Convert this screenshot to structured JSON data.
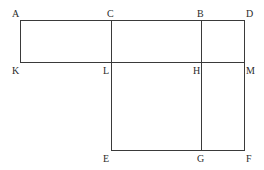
{
  "figure": {
    "background_color": "#ffffff",
    "line_color": "#3a3a3a",
    "label_color": "#2b2b2b",
    "width": 264,
    "height": 170,
    "vertices": [
      {
        "id": "A",
        "label": "A",
        "x": 20,
        "y": 20,
        "label_x": 12,
        "label_y": 9
      },
      {
        "id": "C",
        "label": "C",
        "x": 111,
        "y": 20,
        "label_x": 107,
        "label_y": 9
      },
      {
        "id": "B",
        "label": "B",
        "x": 201,
        "y": 20,
        "label_x": 197,
        "label_y": 9
      },
      {
        "id": "D",
        "label": "D",
        "x": 244,
        "y": 20,
        "label_x": 246,
        "label_y": 9
      },
      {
        "id": "K",
        "label": "K",
        "x": 20,
        "y": 62,
        "label_x": 12,
        "label_y": 66
      },
      {
        "id": "L",
        "label": "L",
        "x": 111,
        "y": 62,
        "label_x": 103,
        "label_y": 66
      },
      {
        "id": "H",
        "label": "H",
        "x": 201,
        "y": 62,
        "label_x": 193,
        "label_y": 66
      },
      {
        "id": "M",
        "label": "M",
        "x": 244,
        "y": 62,
        "label_x": 246,
        "label_y": 66
      },
      {
        "id": "E",
        "label": "E",
        "x": 111,
        "y": 150,
        "label_x": 103,
        "label_y": 154
      },
      {
        "id": "G",
        "label": "G",
        "x": 201,
        "y": 150,
        "label_x": 197,
        "label_y": 154
      },
      {
        "id": "F",
        "label": "F",
        "x": 244,
        "y": 150,
        "label_x": 246,
        "label_y": 154
      }
    ],
    "segments": [
      {
        "id": "A-D",
        "name": "top-edge",
        "x1": 20,
        "y1": 20,
        "x2": 244,
        "y2": 20
      },
      {
        "id": "K-M",
        "name": "middle-horizontal",
        "x1": 20,
        "y1": 62,
        "x2": 244,
        "y2": 62
      },
      {
        "id": "E-F",
        "name": "bottom-edge",
        "x1": 111,
        "y1": 150,
        "x2": 244,
        "y2": 150
      },
      {
        "id": "A-K",
        "name": "left-edge",
        "x1": 20,
        "y1": 20,
        "x2": 20,
        "y2": 62
      },
      {
        "id": "C-E",
        "name": "vertical-through-L",
        "x1": 111,
        "y1": 20,
        "x2": 111,
        "y2": 150
      },
      {
        "id": "B-G",
        "name": "vertical-through-H",
        "x1": 201,
        "y1": 20,
        "x2": 201,
        "y2": 150
      },
      {
        "id": "D-F",
        "name": "right-edge",
        "x1": 244,
        "y1": 20,
        "x2": 244,
        "y2": 150
      }
    ]
  }
}
